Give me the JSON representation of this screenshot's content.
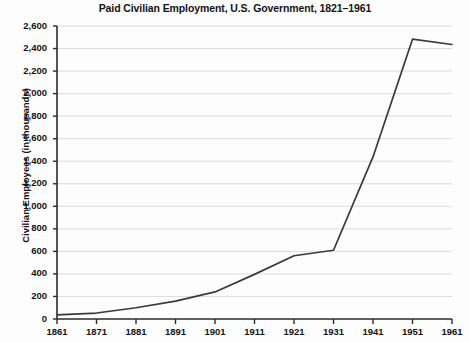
{
  "chart_data": {
    "type": "line",
    "title": "Paid Civilian Employment, U.S. Government, 1821–1961",
    "xlabel": "",
    "ylabel": "Civilian Employees (in thousands)",
    "x": [
      1861,
      1871,
      1881,
      1891,
      1901,
      1911,
      1921,
      1931,
      1941,
      1951,
      1961
    ],
    "values": [
      37,
      53,
      100,
      158,
      240,
      396,
      561,
      610,
      1438,
      2483,
      2436
    ],
    "series": [
      {
        "name": "Paid Civilian Employment",
        "values": [
          37,
          53,
          100,
          158,
          240,
          396,
          561,
          610,
          1438,
          2483,
          2436
        ]
      }
    ],
    "categories": [
      "1861",
      "1871",
      "1881",
      "1891",
      "1901",
      "1911",
      "1921",
      "1931",
      "1941",
      "1951",
      "1961"
    ],
    "xlim": [
      1861,
      1961
    ],
    "ylim": [
      0,
      2600
    ],
    "ytick_values": [
      0,
      200,
      400,
      600,
      800,
      1000,
      1200,
      1400,
      1600,
      1800,
      2000,
      2200,
      2400,
      2600
    ],
    "ytick_labels": [
      "0",
      "200",
      "400",
      "600",
      "800",
      "1,000",
      "1,200",
      "1,400",
      "1,600",
      "1,800",
      "2,000",
      "2,200",
      "2,400",
      "2,600"
    ],
    "xtick_labels": [
      "1861",
      "1871",
      "1881",
      "1891",
      "1901",
      "1911",
      "1921",
      "1931",
      "1941",
      "1951",
      "1961"
    ],
    "grid": "horizontal",
    "legend": "none",
    "colors": {
      "line": "#3a3a3a",
      "axis": "#2b2b2b",
      "grid": "#d8d8d8",
      "background": "#fdfdfd",
      "text": "#141414"
    }
  }
}
